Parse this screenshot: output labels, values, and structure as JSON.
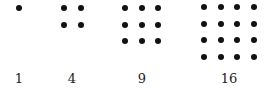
{
  "dot_color": "#111111",
  "groups": [
    {
      "label": "1",
      "side": 1,
      "x0": 19,
      "y0": 8,
      "cx": 19
    },
    {
      "label": "4",
      "side": 2,
      "x0": 64,
      "y0": 8,
      "cx": 72
    },
    {
      "label": "9",
      "side": 3,
      "x0": 125,
      "y0": 8,
      "cx": 142
    },
    {
      "label": "16",
      "side": 4,
      "x0": 204,
      "y0": 7,
      "cx": 229
    }
  ],
  "spacing": 16.5
}
